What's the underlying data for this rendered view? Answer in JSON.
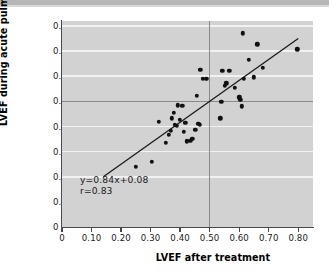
{
  "chart_data": {
    "type": "scatter",
    "title": "",
    "xlabel": "LVEF after treatment",
    "ylabel": "LVEF during acute pulmonary oedema",
    "xlim": [
      0.0,
      0.85
    ],
    "ylim": [
      0.0,
      0.82
    ],
    "x_ticks": [
      0,
      0.1,
      0.2,
      0.3,
      0.4,
      0.5,
      0.6,
      0.7,
      0.8
    ],
    "x_tick_labels": [
      "0",
      "0.10",
      "0.20",
      "0.30",
      "0.40",
      "0.50",
      "0.60",
      "0.70",
      "0.80"
    ],
    "y_ticks": [
      0,
      0.1,
      0.2,
      0.3,
      0.4,
      0.5,
      0.6,
      0.7,
      0.8
    ],
    "y_tick_labels": [
      "0",
      "0.10",
      "0.20",
      "0.30",
      "0.40",
      "0.50",
      "0.60",
      "0.70",
      "0.80"
    ],
    "grid": true,
    "gridlines_y": [
      0.2,
      0.3,
      0.4,
      0.5,
      0.6,
      0.7,
      0.8
    ],
    "reference_lines": {
      "horizontal": 0.5,
      "vertical": 0.5
    },
    "legend": "none",
    "annotations": {
      "equation": "y=0.84x+0.08",
      "correlation": "r=0.83"
    },
    "fit_line": {
      "slope": 0.84,
      "intercept": 0.08,
      "x_start": 0.14,
      "x_end": 0.8,
      "y_start": 0.2,
      "y_end": 0.75
    },
    "points": [
      {
        "x": 0.25,
        "y": 0.24
      },
      {
        "x": 0.305,
        "y": 0.26
      },
      {
        "x": 0.327,
        "y": 0.418
      },
      {
        "x": 0.352,
        "y": 0.335
      },
      {
        "x": 0.362,
        "y": 0.368
      },
      {
        "x": 0.368,
        "y": 0.382
      },
      {
        "x": 0.372,
        "y": 0.432
      },
      {
        "x": 0.378,
        "y": 0.455
      },
      {
        "x": 0.383,
        "y": 0.407
      },
      {
        "x": 0.389,
        "y": 0.403
      },
      {
        "x": 0.393,
        "y": 0.484
      },
      {
        "x": 0.399,
        "y": 0.427
      },
      {
        "x": 0.408,
        "y": 0.483
      },
      {
        "x": 0.412,
        "y": 0.378
      },
      {
        "x": 0.418,
        "y": 0.415
      },
      {
        "x": 0.423,
        "y": 0.341
      },
      {
        "x": 0.434,
        "y": 0.343
      },
      {
        "x": 0.441,
        "y": 0.352
      },
      {
        "x": 0.452,
        "y": 0.386
      },
      {
        "x": 0.456,
        "y": 0.522
      },
      {
        "x": 0.462,
        "y": 0.411
      },
      {
        "x": 0.466,
        "y": 0.407
      },
      {
        "x": 0.468,
        "y": 0.625
      },
      {
        "x": 0.477,
        "y": 0.589
      },
      {
        "x": 0.489,
        "y": 0.589
      },
      {
        "x": 0.536,
        "y": 0.433
      },
      {
        "x": 0.54,
        "y": 0.499
      },
      {
        "x": 0.543,
        "y": 0.622
      },
      {
        "x": 0.551,
        "y": 0.563
      },
      {
        "x": 0.557,
        "y": 0.572
      },
      {
        "x": 0.566,
        "y": 0.622
      },
      {
        "x": 0.586,
        "y": 0.553
      },
      {
        "x": 0.601,
        "y": 0.516
      },
      {
        "x": 0.604,
        "y": 0.507
      },
      {
        "x": 0.608,
        "y": 0.481
      },
      {
        "x": 0.612,
        "y": 0.771
      },
      {
        "x": 0.615,
        "y": 0.589
      },
      {
        "x": 0.633,
        "y": 0.666
      },
      {
        "x": 0.649,
        "y": 0.596
      },
      {
        "x": 0.662,
        "y": 0.727
      },
      {
        "x": 0.679,
        "y": 0.634
      },
      {
        "x": 0.797,
        "y": 0.707
      }
    ]
  }
}
